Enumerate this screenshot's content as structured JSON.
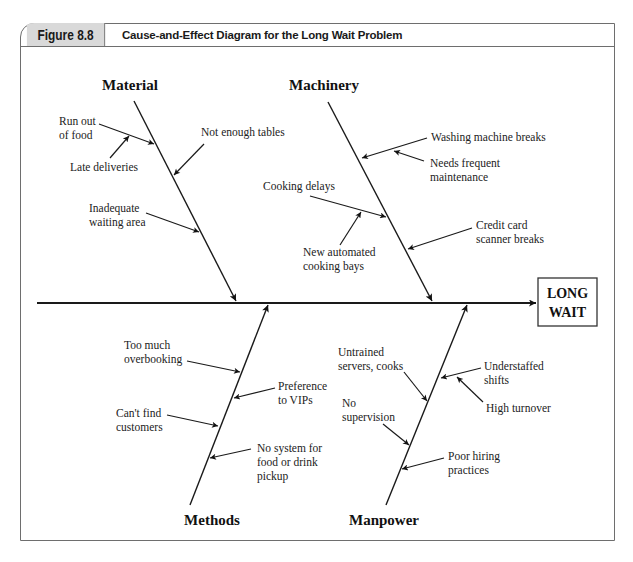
{
  "header": {
    "figure_number": "Figure 8.8",
    "title": "Cause-and-Effect Diagram for the Long Wait Problem"
  },
  "effect": {
    "line1": "LONG",
    "line2": "WAIT"
  },
  "categories": {
    "material": {
      "label": "Material",
      "causes": {
        "run_out": {
          "line1": "Run out",
          "line2": "of food"
        },
        "late_deliveries": {
          "line1": "Late deliveries"
        },
        "not_enough_tables": {
          "line1": "Not enough tables"
        },
        "inadequate_waiting": {
          "line1": "Inadequate",
          "line2": "waiting area"
        }
      }
    },
    "machinery": {
      "label": "Machinery",
      "causes": {
        "washing_machine": {
          "line1": "Washing machine breaks"
        },
        "needs_maintenance": {
          "line1": "Needs frequent",
          "line2": "maintenance"
        },
        "cooking_delays": {
          "line1": "Cooking delays"
        },
        "automated_bays": {
          "line1": "New automated",
          "line2": "cooking bays"
        },
        "credit_card": {
          "line1": "Credit card",
          "line2": "scanner breaks"
        }
      }
    },
    "methods": {
      "label": "Methods",
      "causes": {
        "overbooking": {
          "line1": "Too much",
          "line2": "overbooking"
        },
        "vips": {
          "line1": "Preference",
          "line2": "to VIPs"
        },
        "cant_find": {
          "line1": "Can't find",
          "line2": "customers"
        },
        "no_system": {
          "line1": "No system for",
          "line2": "food or drink",
          "line3": "pickup"
        }
      }
    },
    "manpower": {
      "label": "Manpower",
      "causes": {
        "untrained": {
          "line1": "Untrained",
          "line2": "servers, cooks"
        },
        "understaffed": {
          "line1": "Understaffed",
          "line2": "shifts"
        },
        "turnover": {
          "line1": "High turnover"
        },
        "no_supervision": {
          "line1": "No",
          "line2": "supervision"
        },
        "poor_hiring": {
          "line1": "Poor hiring",
          "line2": "practices"
        }
      }
    }
  }
}
